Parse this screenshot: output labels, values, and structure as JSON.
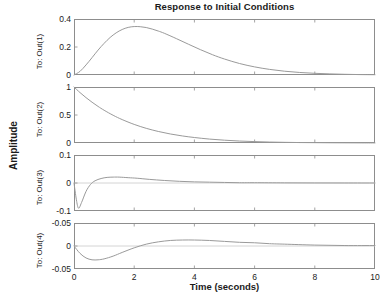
{
  "chart_data": {
    "type": "line",
    "title": "Response to Initial Conditions",
    "xlabel": "Time (seconds)",
    "ylabel": "Amplitude",
    "xlim": [
      0,
      10
    ],
    "xticks": [
      0,
      2,
      4,
      6,
      8,
      10
    ],
    "xticklabels": [
      "0",
      "2",
      "4",
      "6",
      "8",
      "10"
    ],
    "grid": false,
    "legend": null,
    "line_color": "#9a9a9a",
    "axis_color": "#8d8d8d",
    "text_color": "#1b1b1b",
    "subplots": [
      {
        "ylabel": "To: Out(1)",
        "ylim": [
          0,
          0.4
        ],
        "yticks": [
          0,
          0.2,
          0.4
        ],
        "yticklabels": [
          "0",
          "0.2",
          "0.4"
        ],
        "x": [
          0,
          0.2,
          0.4,
          0.6,
          0.8,
          1.0,
          1.2,
          1.4,
          1.6,
          1.8,
          2.0,
          2.2,
          2.4,
          2.6,
          2.8,
          3.0,
          3.4,
          3.8,
          4.2,
          4.6,
          5.0,
          5.5,
          6.0,
          6.5,
          7.0,
          7.5,
          8.0,
          8.5,
          9.0,
          9.5,
          10.0
        ],
        "y": [
          0,
          0.026,
          0.072,
          0.124,
          0.178,
          0.226,
          0.268,
          0.301,
          0.325,
          0.34,
          0.346,
          0.345,
          0.339,
          0.328,
          0.314,
          0.298,
          0.26,
          0.22,
          0.181,
          0.145,
          0.114,
          0.082,
          0.058,
          0.04,
          0.027,
          0.018,
          0.012,
          0.008,
          0.005,
          0.003,
          0.002
        ]
      },
      {
        "ylabel": "To: Out(2)",
        "ylim": [
          0,
          1
        ],
        "yticks": [
          0,
          0.5,
          1
        ],
        "yticklabels": [
          "0",
          "0.5",
          "1"
        ],
        "x": [
          0,
          0.2,
          0.4,
          0.6,
          0.8,
          1.0,
          1.3,
          1.6,
          2.0,
          2.4,
          2.8,
          3.2,
          3.6,
          4.0,
          4.5,
          5.0,
          5.5,
          6.0,
          6.5,
          7.0,
          7.5,
          8.0,
          8.5,
          9.0,
          9.5,
          10.0
        ],
        "y": [
          1.0,
          0.9,
          0.81,
          0.728,
          0.653,
          0.585,
          0.495,
          0.418,
          0.332,
          0.262,
          0.206,
          0.161,
          0.126,
          0.098,
          0.07,
          0.05,
          0.035,
          0.025,
          0.017,
          0.012,
          0.008,
          0.006,
          0.004,
          0.003,
          0.002,
          0.001
        ]
      },
      {
        "ylabel": "To: Out(3)",
        "ylim": [
          -0.1,
          0.1
        ],
        "yticks": [
          -0.1,
          0,
          0.1
        ],
        "yticklabels": [
          "-0.1",
          "0",
          "0.1"
        ],
        "x": [
          0,
          0.08,
          0.15,
          0.25,
          0.4,
          0.55,
          0.7,
          0.9,
          1.1,
          1.3,
          1.5,
          1.8,
          2.1,
          2.5,
          3.0,
          3.5,
          4.0,
          4.5,
          5.0,
          5.5,
          6.0,
          7.0,
          8.0,
          9.0,
          10.0
        ],
        "y": [
          0,
          -0.06,
          -0.09,
          -0.07,
          -0.03,
          -0.005,
          0.008,
          0.016,
          0.02,
          0.021,
          0.021,
          0.019,
          0.017,
          0.013,
          0.009,
          0.006,
          0.004,
          0.003,
          0.002,
          0.001,
          0.001,
          0.0005,
          0.0002,
          0.0001,
          0
        ]
      },
      {
        "ylabel": "To: Out(4)",
        "ylim": [
          -0.05,
          0.05
        ],
        "yticks": [
          -0.05,
          0,
          0.05
        ],
        "yticklabels": [
          "-0.05",
          "0",
          "-0.05"
        ],
        "x": [
          0,
          0.2,
          0.4,
          0.6,
          0.8,
          1.0,
          1.3,
          1.6,
          2.0,
          2.4,
          2.8,
          3.2,
          3.6,
          4.0,
          4.5,
          5.0,
          5.5,
          6.0,
          6.5,
          7.0,
          8.0,
          9.0,
          10.0
        ],
        "y": [
          0,
          -0.016,
          -0.026,
          -0.03,
          -0.03,
          -0.028,
          -0.022,
          -0.014,
          -0.004,
          0.004,
          0.009,
          0.012,
          0.013,
          0.013,
          0.012,
          0.01,
          0.008,
          0.007,
          0.005,
          0.004,
          0.002,
          0.001,
          0.001
        ]
      }
    ]
  }
}
